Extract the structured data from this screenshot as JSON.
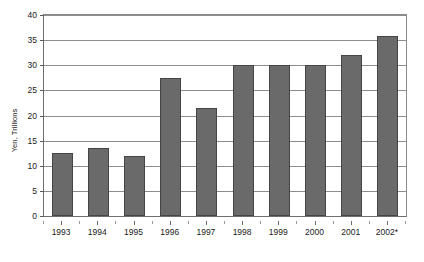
{
  "chart_data": {
    "type": "bar",
    "title": "",
    "subtitle": "",
    "xlabel": "",
    "ylabel": "Yen, Trillions",
    "categories": [
      "1993",
      "1994",
      "1995",
      "1996",
      "1997",
      "1998",
      "1999",
      "2000",
      "2001",
      "2002*"
    ],
    "values": [
      12.5,
      13.5,
      12.0,
      27.5,
      21.5,
      30.0,
      30.0,
      30.0,
      32.0,
      35.8
    ],
    "ylim": [
      0,
      40
    ],
    "ytick_values": [
      0,
      5,
      10,
      15,
      20,
      25,
      30,
      35,
      40
    ],
    "ytick_labels": [
      "0",
      "5",
      "10",
      "15",
      "20",
      "25",
      "30",
      "35",
      "40"
    ],
    "grid": true,
    "grid_axis": "y",
    "legend": false,
    "legend_position": "none",
    "annotations": [],
    "series": [
      {
        "name": "Yen, Trillions",
        "values": [
          12.5,
          13.5,
          12.0,
          27.5,
          21.5,
          30.0,
          30.0,
          30.0,
          32.0,
          35.8
        ],
        "color": "#6a6a6a",
        "edge_color": "#454545"
      }
    ]
  },
  "colors": {
    "bar_fill": "#6a6a6a",
    "bar_edge": "#454545",
    "gridline": "#8d8d8d",
    "axis": "#6e6e6e",
    "text": "#1a1a1a",
    "background": "#ffffff"
  }
}
